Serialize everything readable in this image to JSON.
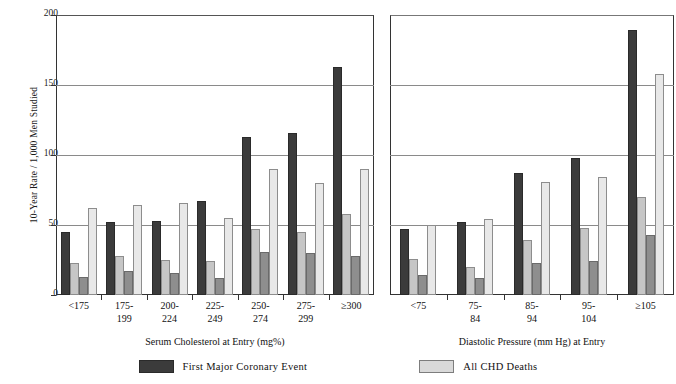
{
  "chart_data": {
    "type": "bar",
    "title": "",
    "ylabel": "10-Year Rate / 1,000 Men Studied",
    "ylim": [
      0,
      200
    ],
    "yticks": [
      0,
      50,
      100,
      150,
      200
    ],
    "grid": true,
    "legend_position": "bottom",
    "legend": [
      {
        "key": "first_major_coronary_event",
        "label": "First Major Coronary Event",
        "color": "#3b3b3b"
      },
      {
        "key": "all_chd_deaths",
        "label": "All CHD Deaths",
        "color": "#d9d9d9"
      }
    ],
    "panels": [
      {
        "id": "serum-cholesterol",
        "xlabel": "Serum Cholesterol at Entry (mg%)",
        "categories": [
          "<175",
          "175-\n199",
          "200-\n224",
          "225-\n249",
          "250-\n274",
          "275-\n299",
          "≥300"
        ],
        "series": [
          {
            "name": "First Major Coronary Event",
            "color": "#3b3b3b",
            "values": [
              45,
              52,
              53,
              67,
              113,
              116,
              163
            ]
          },
          {
            "name": "Series 2",
            "color": "#c6c6c6",
            "values": [
              23,
              28,
              25,
              24,
              47,
              45,
              58
            ]
          },
          {
            "name": "Series 3",
            "color": "#8e8e8e",
            "values": [
              13,
              17,
              16,
              12,
              31,
              30,
              28
            ]
          },
          {
            "name": "All CHD Deaths",
            "color": "#e8e8e8",
            "values": [
              62,
              64,
              66,
              55,
              90,
              80,
              90
            ]
          }
        ]
      },
      {
        "id": "diastolic-pressure",
        "xlabel": "Diastolic Pressure (mm Hg) at Entry",
        "categories": [
          "<75",
          "75-\n84",
          "85-\n94",
          "95-\n104",
          "≥105"
        ],
        "series": [
          {
            "name": "First Major Coronary Event",
            "color": "#3b3b3b",
            "values": [
              47,
              52,
              87,
              98,
              189
            ]
          },
          {
            "name": "Series 2",
            "color": "#c6c6c6",
            "values": [
              26,
              20,
              39,
              48,
              70
            ]
          },
          {
            "name": "Series 3",
            "color": "#8e8e8e",
            "values": [
              14,
              12,
              23,
              24,
              43
            ]
          },
          {
            "name": "All CHD Deaths",
            "color": "#e8e8e8",
            "values": [
              50,
              54,
              81,
              84,
              158
            ]
          }
        ]
      }
    ]
  }
}
